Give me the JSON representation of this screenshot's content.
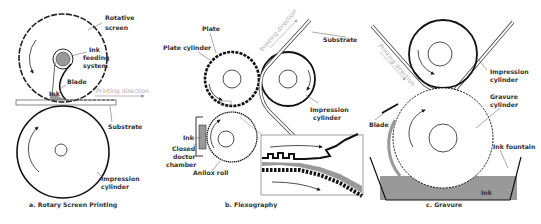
{
  "panels": {
    "rotary": {
      "caption": "a. Rotary Screen Printing",
      "labels": {
        "rotative_1": "Rotative",
        "rotative_2": "screen",
        "ink_feeding_1": "Ink",
        "ink_feeding_2": "feeding",
        "ink_feeding_3": "system",
        "blade": "Blade",
        "ink": "Ink",
        "printing_direction": "Printing direction",
        "substrate": "Substrate",
        "impression_1": "Impression",
        "impression_2": "cylinder"
      }
    },
    "flexo": {
      "caption": "b. Flexography",
      "labels": {
        "plate": "Plate",
        "plate_cylinder": "Plate cylinder",
        "printing_direction": "Printing direction",
        "substrate": "Substrate",
        "impression_1": "Impression",
        "impression_2": "cylinder",
        "ink": "Ink",
        "closed_1": "Closed",
        "closed_2": "doctor",
        "closed_3": "chamber",
        "anilox": "Anilox roll"
      }
    },
    "gravure": {
      "caption": "c. Gravure",
      "labels": {
        "printing_direction": "Printing direction",
        "impression_1": "Impression",
        "impression_2": "cylinder",
        "gravure_1": "Gravure",
        "gravure_2": "cylinder",
        "blade": "Blade",
        "ink_fountain": "Ink fountain",
        "ink": "Ink"
      }
    }
  }
}
